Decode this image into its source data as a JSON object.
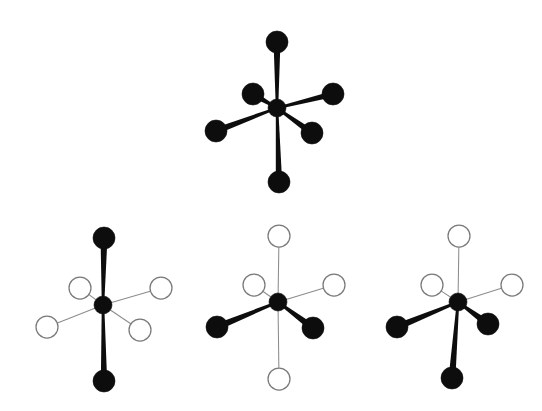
{
  "figure": {
    "background_color": "#ffffff",
    "width": 542,
    "height": 411,
    "filled_atom_color": "#0d0d0d",
    "open_atom_fill": "#ffffff",
    "open_atom_stroke": "#7a7a7a",
    "filled_bond_color": "#0d0d0d",
    "open_bond_color": "#8c8c8c",
    "atom_radius": 11,
    "center_radius": 9
  },
  "chart_data": {
    "type": "diagram",
    "xlabel": "",
    "ylabel": "",
    "grid": false,
    "legend": [
      {
        "label": "filled ligand",
        "marker": "filled-circle",
        "color": "#0d0d0d"
      },
      {
        "label": "open ligand",
        "marker": "open-circle",
        "color": "#ffffff"
      }
    ],
    "structures": [
      {
        "id": "structure-top",
        "name": "homoleptic-octahedron",
        "label": "",
        "center": {
          "x": 277,
          "y": 108,
          "r": 9,
          "type": "filled"
        },
        "vertices": [
          {
            "position": "axial-up",
            "x": 277,
            "y": 42,
            "r": 11,
            "type": "filled",
            "bond": "wedge",
            "bond_width": 6.5
          },
          {
            "position": "axial-down",
            "x": 279,
            "y": 182,
            "r": 11,
            "type": "filled",
            "bond": "wedge",
            "bond_width": 6.0
          },
          {
            "position": "equatorial-upper-left",
            "x": 253,
            "y": 94,
            "r": 11,
            "type": "filled",
            "bond": "wedge",
            "bond_width": 5.5
          },
          {
            "position": "equatorial-upper-right",
            "x": 333,
            "y": 94,
            "r": 11,
            "type": "filled",
            "bond": "wedge",
            "bond_width": 5.5
          },
          {
            "position": "equatorial-lower-left",
            "x": 216,
            "y": 131,
            "r": 11,
            "type": "filled",
            "bond": "wedge",
            "bond_width": 6.0
          },
          {
            "position": "equatorial-lower-right",
            "x": 312,
            "y": 133,
            "r": 11,
            "type": "filled",
            "bond": "wedge",
            "bond_width": 6.0
          }
        ]
      },
      {
        "id": "structure-bottom-left",
        "name": "trans-axial-isomer",
        "label": "",
        "center": {
          "x": 103,
          "y": 305,
          "r": 9,
          "type": "filled"
        },
        "vertices": [
          {
            "position": "axial-up",
            "x": 104,
            "y": 238,
            "r": 11,
            "type": "filled",
            "bond": "wedge",
            "bond_width": 6.5
          },
          {
            "position": "axial-down",
            "x": 104,
            "y": 381,
            "r": 11,
            "type": "filled",
            "bond": "wedge",
            "bond_width": 6.0
          },
          {
            "position": "equatorial-upper-left",
            "x": 80,
            "y": 288,
            "r": 11,
            "type": "open",
            "bond": "line",
            "bond_width": 1.05
          },
          {
            "position": "equatorial-upper-right",
            "x": 161,
            "y": 288,
            "r": 11,
            "type": "open",
            "bond": "line",
            "bond_width": 1.05
          },
          {
            "position": "equatorial-lower-left",
            "x": 47,
            "y": 327,
            "r": 11,
            "type": "open",
            "bond": "line",
            "bond_width": 1.05
          },
          {
            "position": "equatorial-lower-right",
            "x": 140,
            "y": 330,
            "r": 11,
            "type": "open",
            "bond": "line",
            "bond_width": 1.05
          }
        ]
      },
      {
        "id": "structure-bottom-middle",
        "name": "cis-equatorial-isomer",
        "label": "",
        "center": {
          "x": 278,
          "y": 302,
          "r": 9,
          "type": "filled"
        },
        "vertices": [
          {
            "position": "axial-up",
            "x": 279,
            "y": 236,
            "r": 11,
            "type": "open",
            "bond": "line",
            "bond_width": 1.05
          },
          {
            "position": "axial-down",
            "x": 279,
            "y": 379,
            "r": 11,
            "type": "open",
            "bond": "line",
            "bond_width": 1.05
          },
          {
            "position": "equatorial-upper-left",
            "x": 254,
            "y": 285,
            "r": 11,
            "type": "open",
            "bond": "line",
            "bond_width": 1.05
          },
          {
            "position": "equatorial-upper-right",
            "x": 334,
            "y": 285,
            "r": 11,
            "type": "open",
            "bond": "line",
            "bond_width": 1.05
          },
          {
            "position": "equatorial-lower-left",
            "x": 217,
            "y": 327,
            "r": 11,
            "type": "filled",
            "bond": "wedge",
            "bond_width": 6.5
          },
          {
            "position": "equatorial-lower-right",
            "x": 313,
            "y": 328,
            "r": 11,
            "type": "filled",
            "bond": "wedge",
            "bond_width": 6.5
          }
        ]
      },
      {
        "id": "structure-bottom-right",
        "name": "facial-isomer",
        "label": "",
        "center": {
          "x": 458,
          "y": 302,
          "r": 9,
          "type": "filled"
        },
        "vertices": [
          {
            "position": "axial-up",
            "x": 459,
            "y": 236,
            "r": 11,
            "type": "open",
            "bond": "line",
            "bond_width": 1.05
          },
          {
            "position": "axial-down",
            "x": 452,
            "y": 378,
            "r": 11,
            "type": "filled",
            "bond": "wedge",
            "bond_width": 6.5
          },
          {
            "position": "equatorial-upper-left",
            "x": 432,
            "y": 285,
            "r": 11,
            "type": "open",
            "bond": "line",
            "bond_width": 1.05
          },
          {
            "position": "equatorial-upper-right",
            "x": 512,
            "y": 285,
            "r": 11,
            "type": "open",
            "bond": "line",
            "bond_width": 1.05
          },
          {
            "position": "equatorial-lower-left",
            "x": 397,
            "y": 327,
            "r": 11,
            "type": "filled",
            "bond": "wedge",
            "bond_width": 6.5
          },
          {
            "position": "equatorial-lower-right",
            "x": 488,
            "y": 324,
            "r": 11,
            "type": "filled",
            "bond": "wedge",
            "bond_width": 6.5
          }
        ]
      }
    ]
  }
}
